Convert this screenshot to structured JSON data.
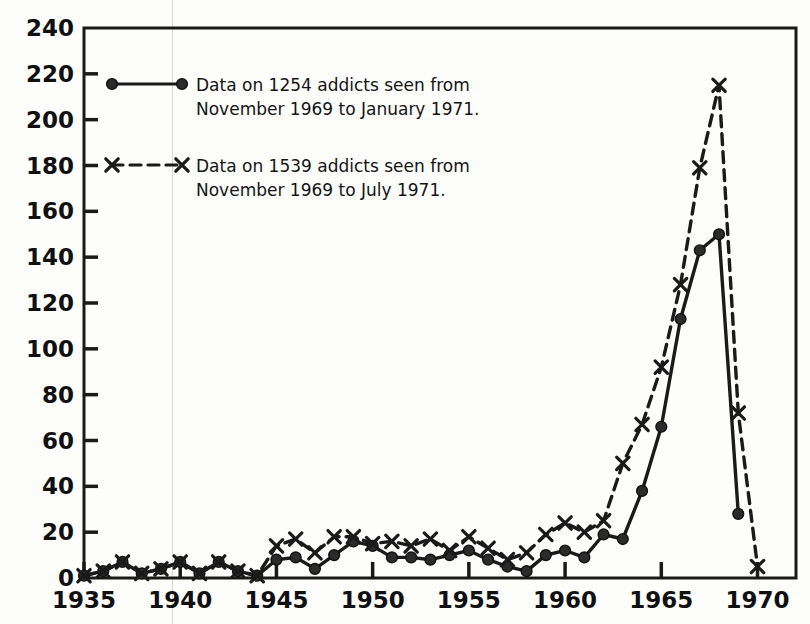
{
  "chart_data": {
    "type": "line",
    "title": "",
    "xlabel": "",
    "ylabel": "",
    "xlim": [
      1935,
      1972
    ],
    "ylim": [
      0,
      240
    ],
    "grid": false,
    "legend_position": "top-left",
    "x_ticks": [
      1935,
      1940,
      1945,
      1950,
      1955,
      1960,
      1965,
      1970
    ],
    "y_ticks": [
      0,
      20,
      40,
      60,
      80,
      100,
      120,
      140,
      160,
      180,
      200,
      220,
      240
    ],
    "x": [
      1935,
      1936,
      1937,
      1938,
      1939,
      1940,
      1941,
      1942,
      1943,
      1944,
      1945,
      1946,
      1947,
      1948,
      1949,
      1950,
      1951,
      1952,
      1953,
      1954,
      1955,
      1956,
      1957,
      1958,
      1959,
      1960,
      1961,
      1962,
      1963,
      1964,
      1965,
      1966,
      1967,
      1968,
      1969,
      1970,
      1971
    ],
    "series": [
      {
        "name": "Data on 1254 addicts seen from November 1969 to January 1971.",
        "marker": "circle",
        "linestyle": "solid",
        "color": "#1a1a1a",
        "values": [
          1,
          3,
          7,
          2,
          4,
          7,
          2,
          7,
          3,
          1,
          8,
          9,
          4,
          10,
          16,
          14,
          9,
          9,
          8,
          10,
          12,
          8,
          5,
          3,
          10,
          12,
          9,
          19,
          17,
          38,
          66,
          113,
          143,
          150,
          28,
          null,
          null
        ]
      },
      {
        "name": "Data on 1539 addicts seen from November 1969 to July 1971.",
        "marker": "x",
        "linestyle": "dashed",
        "color": "#1a1a1a",
        "values": [
          1,
          3,
          7,
          2,
          4,
          7,
          2,
          7,
          3,
          1,
          14,
          17,
          11,
          18,
          18,
          15,
          16,
          14,
          17,
          12,
          18,
          13,
          8,
          11,
          19,
          24,
          20,
          25,
          50,
          67,
          92,
          128,
          179,
          215,
          72,
          5,
          null
        ]
      }
    ]
  },
  "legend": {
    "items": [
      {
        "marker": "circle-solid-line",
        "line1": "Data on 1254 addicts seen from",
        "line2": "November 1969 to January 1971."
      },
      {
        "marker": "x-dashed-line",
        "line1": "Data on 1539 addicts seen from",
        "line2": "November 1969 to July 1971."
      }
    ]
  },
  "axes": {
    "y_labels": [
      "240",
      "220",
      "200",
      "180",
      "160",
      "140",
      "120",
      "100",
      "80",
      "60",
      "40",
      "20",
      "0"
    ],
    "x_labels": [
      "1935",
      "1940",
      "1945",
      "1950",
      "1955",
      "1960",
      "1965",
      "1970"
    ]
  },
  "colors": {
    "ink": "#1a1a1a",
    "paper": "#fdfdfc",
    "scanline": "#d9d9d6"
  }
}
